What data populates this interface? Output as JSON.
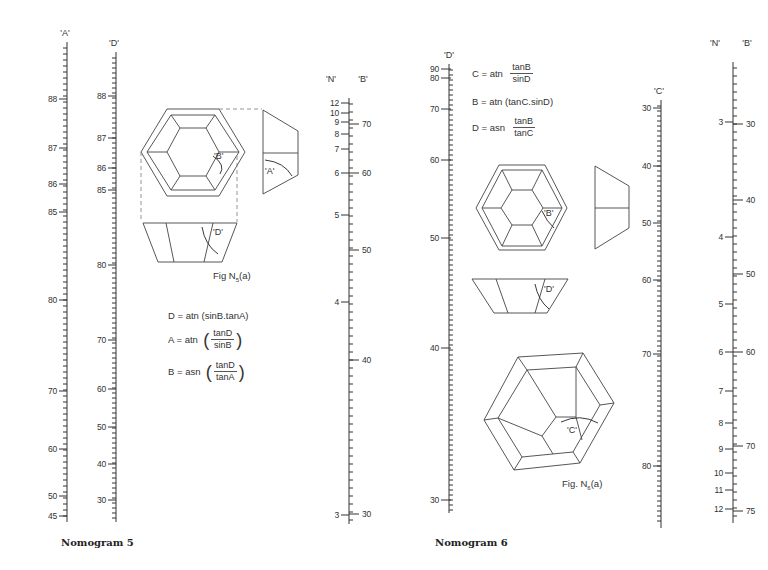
{
  "nomogram5": {
    "caption": "Nomogram 5",
    "figure_caption": {
      "text": "Fig N",
      "sub": "5",
      "suffix": "(a)"
    },
    "formulas": [
      {
        "lhs": "D = atn",
        "plain": "(sinB.tanA)"
      },
      {
        "lhs": "A = atn",
        "num": "tanD",
        "den": "sinB",
        "paren": true
      },
      {
        "lhs": "B = asn",
        "num": "tanD",
        "den": "tanA",
        "paren": true
      }
    ],
    "angle_labels": {
      "B": "'B'",
      "A": "'A'",
      "D": "'D'"
    },
    "scales": {
      "A": {
        "label": "'A'",
        "x": 67,
        "y_top": 42,
        "y_bottom": 522,
        "labels": [
          {
            "v": "88",
            "y": 99
          },
          {
            "v": "87",
            "y": 148
          },
          {
            "v": "86",
            "y": 184
          },
          {
            "v": "85",
            "y": 212
          },
          {
            "v": "80",
            "y": 300
          },
          {
            "v": "70",
            "y": 391
          },
          {
            "v": "60",
            "y": 449
          },
          {
            "v": "50",
            "y": 496
          },
          {
            "v": "45",
            "y": 516
          }
        ]
      },
      "D": {
        "label": "'D'",
        "x": 116,
        "y_top": 52,
        "y_bottom": 522,
        "labels": [
          {
            "v": "88",
            "y": 96
          },
          {
            "v": "87",
            "y": 138
          },
          {
            "v": "86",
            "y": 168
          },
          {
            "v": "85",
            "y": 190
          },
          {
            "v": "80",
            "y": 265
          },
          {
            "v": "70",
            "y": 340
          },
          {
            "v": "60",
            "y": 389
          },
          {
            "v": "50",
            "y": 427
          },
          {
            "v": "40",
            "y": 464
          },
          {
            "v": "30",
            "y": 500
          }
        ]
      },
      "N": {
        "label": "'N'",
        "x": 349,
        "y_top": 98,
        "y_bottom": 524,
        "labels": [
          {
            "v": "12",
            "y": 103
          },
          {
            "v": "10",
            "y": 113
          },
          {
            "v": "9",
            "y": 122
          },
          {
            "v": "8",
            "y": 134
          },
          {
            "v": "7",
            "y": 149
          },
          {
            "v": "6",
            "y": 173
          },
          {
            "v": "5",
            "y": 215
          },
          {
            "v": "4",
            "y": 302
          },
          {
            "v": "3",
            "y": 515
          }
        ]
      },
      "B": {
        "label": "'B'",
        "x": 349,
        "labels": [
          {
            "v": "70",
            "y": 124
          },
          {
            "v": "60",
            "y": 173
          },
          {
            "v": "50",
            "y": 250
          },
          {
            "v": "40",
            "y": 360
          },
          {
            "v": "30",
            "y": 514
          }
        ]
      }
    }
  },
  "nomogram6": {
    "caption": "Nomogram 6",
    "figure_caption": {
      "text": "Fig. N",
      "sub": "6",
      "suffix": "(a)"
    },
    "formulas": [
      {
        "lhs": "C = atn",
        "num": "tanB",
        "den": "sinD",
        "paren": false
      },
      {
        "lhs": "B = atn",
        "plain": "(tanC.sinD)"
      },
      {
        "lhs": "D = asn",
        "num": "tanB",
        "den": "tanC",
        "paren": false
      }
    ],
    "angle_labels": {
      "B": "'B'",
      "D": "'D'",
      "C": "'C'"
    },
    "scales": {
      "D": {
        "label": "'D'",
        "x": 449,
        "y_top": 64,
        "y_bottom": 513,
        "labels": [
          {
            "v": "90",
            "y": 69
          },
          {
            "v": "80",
            "y": 78
          },
          {
            "v": "70",
            "y": 109
          },
          {
            "v": "60",
            "y": 160
          },
          {
            "v": "50",
            "y": 238
          },
          {
            "v": "40",
            "y": 348
          },
          {
            "v": "30",
            "y": 500
          }
        ]
      },
      "C": {
        "label": "'C'",
        "x": 661,
        "y_top": 100,
        "y_bottom": 528,
        "labels": [
          {
            "v": "30",
            "y": 108
          },
          {
            "v": "40",
            "y": 166
          },
          {
            "v": "50",
            "y": 223
          },
          {
            "v": "60",
            "y": 280
          },
          {
            "v": "70",
            "y": 354
          },
          {
            "v": "80",
            "y": 466
          }
        ]
      },
      "N": {
        "label": "'N'",
        "x": 733,
        "y_top": 62,
        "y_bottom": 523,
        "labels": [
          {
            "v": "3",
            "y": 122
          },
          {
            "v": "4",
            "y": 237
          },
          {
            "v": "5",
            "y": 304
          },
          {
            "v": "6",
            "y": 352
          },
          {
            "v": "7",
            "y": 391
          },
          {
            "v": "8",
            "y": 423
          },
          {
            "v": "9",
            "y": 449
          },
          {
            "v": "10",
            "y": 473
          },
          {
            "v": "11",
            "y": 490
          },
          {
            "v": "12",
            "y": 509
          }
        ]
      },
      "B": {
        "label": "'B'",
        "x": 733,
        "labels": [
          {
            "v": "30",
            "y": 124
          },
          {
            "v": "40",
            "y": 200
          },
          {
            "v": "50",
            "y": 274
          },
          {
            "v": "60",
            "y": 352
          },
          {
            "v": "70",
            "y": 446
          },
          {
            "v": "75",
            "y": 511
          }
        ]
      }
    }
  }
}
